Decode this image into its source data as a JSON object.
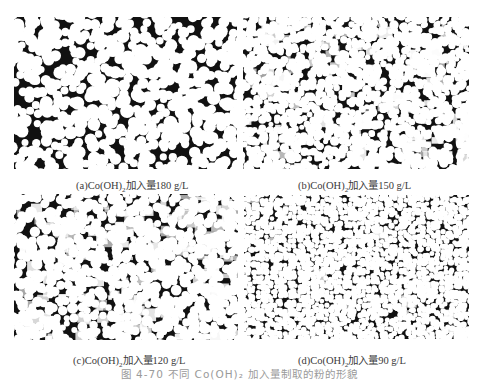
{
  "figure": {
    "caption": "图 4-70  不同 Co(OH)₂ 加入量制取的粉的形貌",
    "panels": [
      {
        "id": "a",
        "label_prefix": "(a)Co(OH)",
        "label_sub": "2",
        "label_suffix": "加入量180 g/L",
        "texture": "coarse-dense"
      },
      {
        "id": "b",
        "label_prefix": "(b)Co(OH)",
        "label_sub": "2",
        "label_suffix": "加入量150 g/L",
        "texture": "medium-sparse"
      },
      {
        "id": "c",
        "label_prefix": "(c)Co(OH)",
        "label_sub": "2",
        "label_suffix": "加入量120  g/L",
        "texture": "medium-faded"
      },
      {
        "id": "d",
        "label_prefix": "(d)Co(OH)",
        "label_sub": "2",
        "label_suffix": "加入量90  g/L",
        "texture": "fine-uniform"
      }
    ]
  }
}
